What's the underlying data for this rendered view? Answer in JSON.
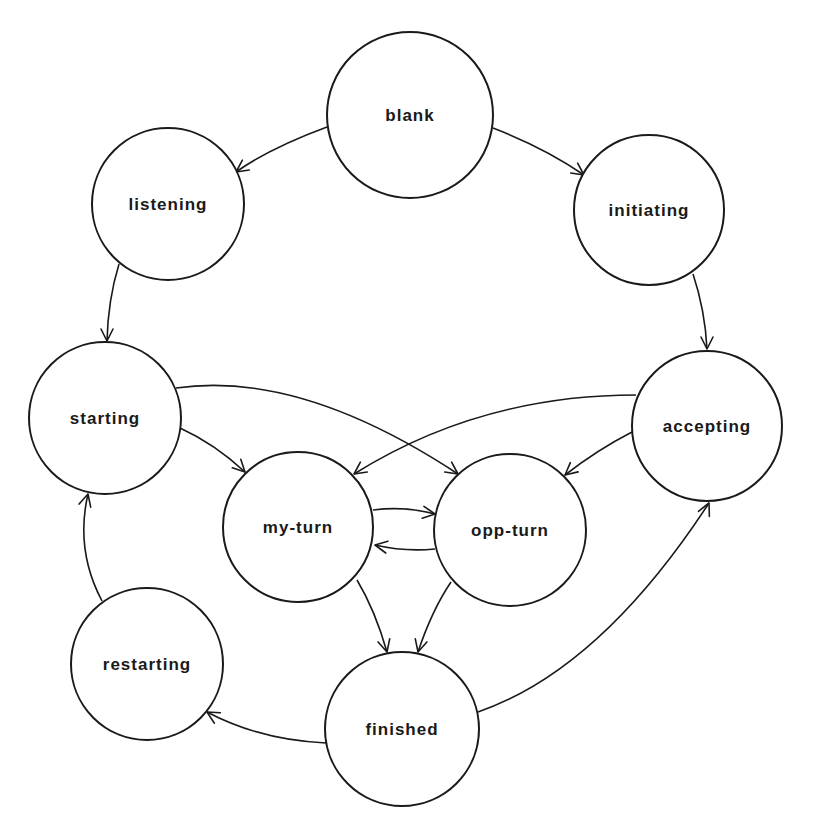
{
  "diagram": {
    "type": "state-machine",
    "nodes": [
      {
        "id": "blank",
        "label": "blank",
        "cx": 410,
        "cy": 115,
        "r": 83
      },
      {
        "id": "listening",
        "label": "listening",
        "cx": 168,
        "cy": 204,
        "r": 76
      },
      {
        "id": "initiating",
        "label": "initiating",
        "cx": 649,
        "cy": 210,
        "r": 75
      },
      {
        "id": "starting",
        "label": "starting",
        "cx": 105,
        "cy": 418,
        "r": 76
      },
      {
        "id": "accepting",
        "label": "accepting",
        "cx": 707,
        "cy": 426,
        "r": 75
      },
      {
        "id": "my-turn",
        "label": "my-turn",
        "cx": 298,
        "cy": 527,
        "r": 75
      },
      {
        "id": "opp-turn",
        "label": "opp-turn",
        "cx": 510,
        "cy": 530,
        "r": 76
      },
      {
        "id": "restarting",
        "label": "restarting",
        "cx": 147,
        "cy": 664,
        "r": 76
      },
      {
        "id": "finished",
        "label": "finished",
        "cx": 402,
        "cy": 729,
        "r": 77
      }
    ],
    "edges": [
      {
        "from": "blank",
        "to": "listening",
        "d": "M327,127 Q270,148 236,172",
        "ax": 236,
        "ay": 172,
        "angle": 145
      },
      {
        "from": "blank",
        "to": "initiating",
        "d": "M493,128 Q545,148 584,175",
        "ax": 584,
        "ay": 175,
        "angle": 35
      },
      {
        "from": "listening",
        "to": "starting",
        "d": "M119,264 Q108,300 107,341",
        "ax": 107,
        "ay": 341,
        "angle": 90
      },
      {
        "from": "initiating",
        "to": "accepting",
        "d": "M693,274 Q705,310 707,349",
        "ax": 707,
        "ay": 349,
        "angle": 90
      },
      {
        "from": "starting",
        "to": "my-turn",
        "d": "M180,428 Q215,444 245,472",
        "ax": 245,
        "ay": 472,
        "angle": 45
      },
      {
        "from": "starting",
        "to": "opp-turn",
        "d": "M176,388 Q300,370 458,474",
        "ax": 458,
        "ay": 474,
        "angle": 35
      },
      {
        "from": "accepting",
        "to": "my-turn",
        "d": "M636,395 Q480,395 354,474",
        "ax": 354,
        "ay": 474,
        "angle": 145
      },
      {
        "from": "accepting",
        "to": "opp-turn",
        "d": "M632,432 Q597,450 565,475",
        "ax": 565,
        "ay": 475,
        "angle": 140
      },
      {
        "from": "my-turn",
        "to": "opp-turn",
        "d": "M373,510 Q405,506 435,514",
        "ax": 435,
        "ay": 514,
        "angle": 8
      },
      {
        "from": "opp-turn",
        "to": "my-turn",
        "d": "M435,549 Q405,552 375,545",
        "ax": 375,
        "ay": 545,
        "angle": 190
      },
      {
        "from": "my-turn",
        "to": "finished",
        "d": "M357,580 Q375,610 387,652",
        "ax": 387,
        "ay": 652,
        "angle": 75
      },
      {
        "from": "opp-turn",
        "to": "finished",
        "d": "M451,582 Q432,610 418,652",
        "ax": 418,
        "ay": 652,
        "angle": 105
      },
      {
        "from": "finished",
        "to": "restarting",
        "d": "M326,743 Q260,740 207,712",
        "ax": 207,
        "ay": 712,
        "angle": 210
      },
      {
        "from": "finished",
        "to": "accepting",
        "d": "M478,712 Q600,670 709,503",
        "ax": 709,
        "ay": 503,
        "angle": -65
      },
      {
        "from": "restarting",
        "to": "starting",
        "d": "M102,601 Q75,550 88,494",
        "ax": 88,
        "ay": 494,
        "angle": -75
      }
    ]
  }
}
